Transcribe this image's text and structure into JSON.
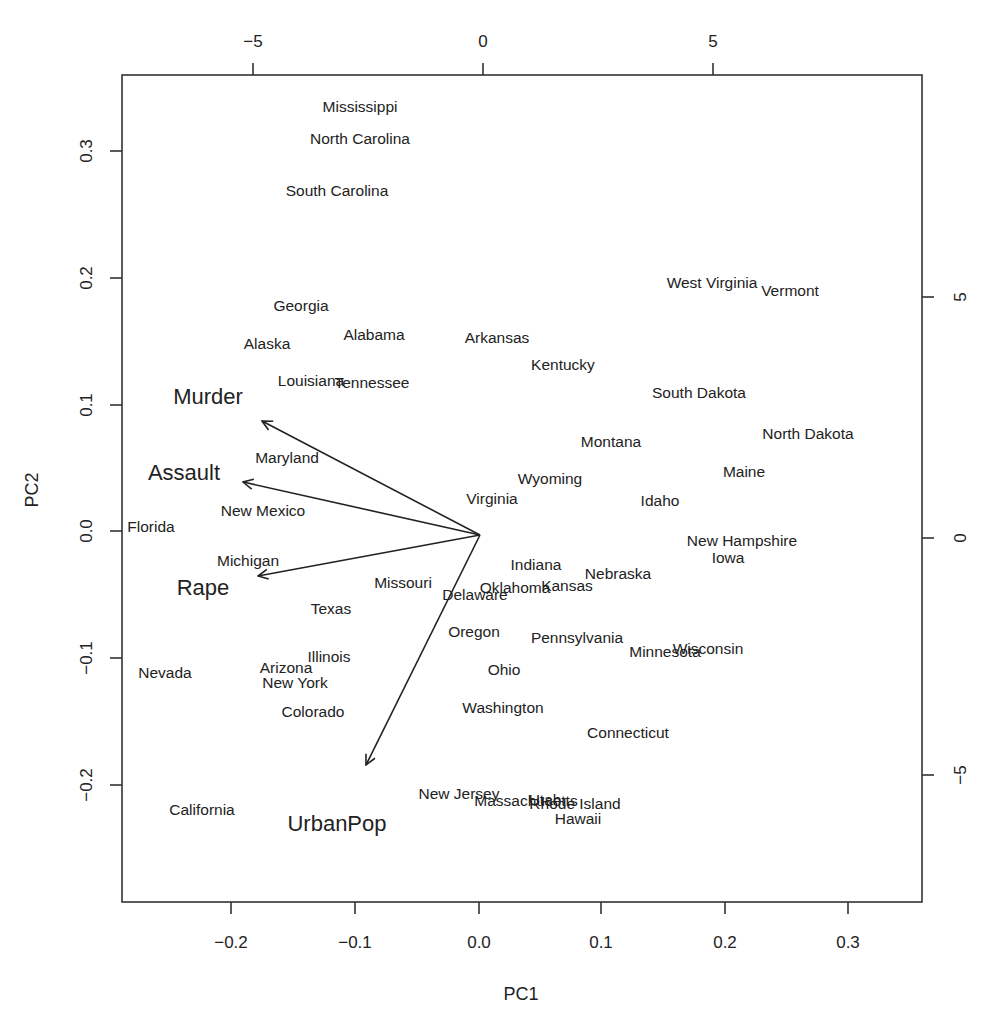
{
  "chart_data": {
    "type": "scatter",
    "subtype": "biplot",
    "title": "",
    "xlabel": "PC1",
    "ylabel": "PC2",
    "xlim": [
      -0.28,
      0.36
    ],
    "ylim": [
      -0.29,
      0.36
    ],
    "grid": false,
    "legend": "none",
    "primary_axes": {
      "bottom_ticks": [
        -0.2,
        -0.1,
        0.0,
        0.1,
        0.2,
        0.3
      ],
      "bottom_tick_labels": [
        "−0.2",
        "−0.1",
        "0.0",
        "0.1",
        "0.2",
        "0.3"
      ],
      "left_ticks": [
        -0.2,
        -0.1,
        0.0,
        0.1,
        0.2,
        0.3
      ],
      "left_tick_labels": [
        "−0.2",
        "−0.1",
        "0.0",
        "0.1",
        "0.2",
        "0.3"
      ]
    },
    "secondary_axes": {
      "top_ticks": [
        -5,
        0,
        5
      ],
      "top_tick_labels": [
        "−5",
        "0",
        "5"
      ],
      "right_ticks": [
        -5,
        0,
        5
      ],
      "right_tick_labels": [
        "−5",
        "0",
        "5"
      ]
    },
    "observations": [
      {
        "name": "Mississippi",
        "x": -0.1,
        "y": 0.33
      },
      {
        "name": "North Carolina",
        "x": -0.1,
        "y": 0.305
      },
      {
        "name": "South Carolina",
        "x": -0.12,
        "y": 0.265
      },
      {
        "name": "Georgia",
        "x": -0.15,
        "y": 0.19
      },
      {
        "name": "Alabama",
        "x": -0.11,
        "y": 0.155
      },
      {
        "name": "Alaska",
        "x": -0.175,
        "y": 0.15
      },
      {
        "name": "Arkansas",
        "x": 0.01,
        "y": 0.155
      },
      {
        "name": "Kentucky",
        "x": 0.068,
        "y": 0.13
      },
      {
        "name": "Louisiana",
        "x": -0.14,
        "y": 0.12
      },
      {
        "name": "Tennessee",
        "x": -0.11,
        "y": 0.117
      },
      {
        "name": "West Virginia",
        "x": 0.185,
        "y": 0.198
      },
      {
        "name": "Vermont",
        "x": 0.25,
        "y": 0.19
      },
      {
        "name": "South Dakota",
        "x": 0.17,
        "y": 0.108
      },
      {
        "name": "North Dakota",
        "x": 0.255,
        "y": 0.07
      },
      {
        "name": "Montana",
        "x": 0.107,
        "y": 0.072
      },
      {
        "name": "Maryland",
        "x": -0.156,
        "y": 0.06
      },
      {
        "name": "Maine",
        "x": 0.21,
        "y": 0.047
      },
      {
        "name": "Wyoming",
        "x": 0.06,
        "y": 0.044
      },
      {
        "name": "Virginia",
        "x": 0.01,
        "y": 0.03
      },
      {
        "name": "Idaho",
        "x": 0.144,
        "y": 0.027
      },
      {
        "name": "New Mexico",
        "x": -0.19,
        "y": 0.018
      },
      {
        "name": "Florida",
        "x": -0.265,
        "y": 0.004
      },
      {
        "name": "New Hampshire",
        "x": 0.215,
        "y": -0.008
      },
      {
        "name": "Iowa",
        "x": 0.2,
        "y": -0.017
      },
      {
        "name": "Michigan",
        "x": -0.2,
        "y": -0.023
      },
      {
        "name": "Indiana",
        "x": 0.045,
        "y": -0.026
      },
      {
        "name": "Nebraska",
        "x": 0.112,
        "y": -0.035
      },
      {
        "name": "Oklahoma",
        "x": 0.028,
        "y": -0.043
      },
      {
        "name": "Kansas",
        "x": 0.07,
        "y": -0.042
      },
      {
        "name": "Missouri",
        "x": -0.062,
        "y": -0.04
      },
      {
        "name": "Delaware",
        "x": -0.004,
        "y": -0.05
      },
      {
        "name": "Rape",
        "x": -0.22,
        "y": -0.045,
        "is_variable_label": true
      },
      {
        "name": "Texas",
        "x": -0.12,
        "y": -0.06
      },
      {
        "name": "Oregon",
        "x": -0.005,
        "y": -0.077
      },
      {
        "name": "Pennsylvania",
        "x": 0.08,
        "y": -0.081
      },
      {
        "name": "Minnesota",
        "x": 0.14,
        "y": -0.092
      },
      {
        "name": "Wisconsin",
        "x": 0.185,
        "y": -0.089
      },
      {
        "name": "Illinois",
        "x": -0.122,
        "y": -0.097
      },
      {
        "name": "Arizona",
        "x": -0.158,
        "y": -0.104
      },
      {
        "name": "Nevada",
        "x": -0.254,
        "y": -0.106
      },
      {
        "name": "Ohio",
        "x": 0.02,
        "y": -0.106
      },
      {
        "name": "New York",
        "x": -0.149,
        "y": -0.113
      },
      {
        "name": "Colorado",
        "x": -0.135,
        "y": -0.137
      },
      {
        "name": "Washington",
        "x": 0.02,
        "y": -0.135
      },
      {
        "name": "Connecticut",
        "x": 0.12,
        "y": -0.155
      },
      {
        "name": "New Jersey",
        "x": -0.028,
        "y": -0.205
      },
      {
        "name": "Massachusetts",
        "x": 0.04,
        "y": -0.21
      },
      {
        "name": "Utah",
        "x": 0.05,
        "y": -0.209
      },
      {
        "name": "Rhode Island",
        "x": 0.078,
        "y": -0.212
      },
      {
        "name": "Hawaii",
        "x": 0.078,
        "y": -0.225
      },
      {
        "name": "California",
        "x": -0.235,
        "y": -0.215
      }
    ],
    "variables": [
      {
        "name": "Murder",
        "x": -0.176,
        "y": 0.089
      },
      {
        "name": "Assault",
        "x": -0.191,
        "y": 0.041
      },
      {
        "name": "Rape",
        "x": -0.179,
        "y": -0.035
      },
      {
        "name": "UrbanPop",
        "x": -0.092,
        "y": -0.183
      }
    ]
  },
  "render": {
    "observation_labels": [
      {
        "text": "Mississippi",
        "px": 360,
        "py": 106
      },
      {
        "text": "North Carolina",
        "px": 360,
        "py": 138
      },
      {
        "text": "South Carolina",
        "px": 337,
        "py": 190
      },
      {
        "text": "Georgia",
        "px": 301,
        "py": 305
      },
      {
        "text": "Alabama",
        "px": 374,
        "py": 334
      },
      {
        "text": "Alaska",
        "px": 267,
        "py": 343
      },
      {
        "text": "Arkansas",
        "px": 497,
        "py": 337
      },
      {
        "text": "Kentucky",
        "px": 563,
        "py": 364
      },
      {
        "text": "Louisiana",
        "px": 311,
        "py": 380
      },
      {
        "text": "Tennessee",
        "px": 372,
        "py": 382
      },
      {
        "text": "West Virginia",
        "px": 712,
        "py": 282
      },
      {
        "text": "Vermont",
        "px": 790,
        "py": 290
      },
      {
        "text": "South Dakota",
        "px": 699,
        "py": 392
      },
      {
        "text": "North Dakota",
        "px": 808,
        "py": 433
      },
      {
        "text": "Montana",
        "px": 611,
        "py": 441
      },
      {
        "text": "Maryland",
        "px": 287,
        "py": 457
      },
      {
        "text": "Maine",
        "px": 744,
        "py": 471
      },
      {
        "text": "Wyoming",
        "px": 550,
        "py": 478
      },
      {
        "text": "Virginia",
        "px": 492,
        "py": 498
      },
      {
        "text": "Idaho",
        "px": 660,
        "py": 500
      },
      {
        "text": "New Mexico",
        "px": 263,
        "py": 510
      },
      {
        "text": "Florida",
        "px": 151,
        "py": 526
      },
      {
        "text": "New Hampshire",
        "px": 742,
        "py": 540
      },
      {
        "text": "Iowa",
        "px": 728,
        "py": 557
      },
      {
        "text": "Michigan",
        "px": 248,
        "py": 560
      },
      {
        "text": "Indiana",
        "px": 536,
        "py": 564
      },
      {
        "text": "Nebraska",
        "px": 618,
        "py": 573
      },
      {
        "text": "Oklahoma",
        "px": 515,
        "py": 587
      },
      {
        "text": "Kansas",
        "px": 567,
        "py": 585
      },
      {
        "text": "Missouri",
        "px": 403,
        "py": 582
      },
      {
        "text": "Delaware",
        "px": 475,
        "py": 594
      },
      {
        "text": "Texas",
        "px": 331,
        "py": 608
      },
      {
        "text": "Oregon",
        "px": 474,
        "py": 631
      },
      {
        "text": "Pennsylvania",
        "px": 577,
        "py": 637
      },
      {
        "text": "Minnesota",
        "px": 665,
        "py": 651
      },
      {
        "text": "Wisconsin",
        "px": 708,
        "py": 648
      },
      {
        "text": "Illinois",
        "px": 329,
        "py": 656
      },
      {
        "text": "Arizona",
        "px": 286,
        "py": 667
      },
      {
        "text": "Nevada",
        "px": 165,
        "py": 672
      },
      {
        "text": "Ohio",
        "px": 504,
        "py": 669
      },
      {
        "text": "New York",
        "px": 295,
        "py": 682
      },
      {
        "text": "Colorado",
        "px": 313,
        "py": 711
      },
      {
        "text": "Washington",
        "px": 503,
        "py": 707
      },
      {
        "text": "Connecticut",
        "px": 628,
        "py": 732
      },
      {
        "text": "New Jersey",
        "px": 459,
        "py": 793
      },
      {
        "text": "Massachusetts",
        "px": 526,
        "py": 800
      },
      {
        "text": "Utah",
        "px": 545,
        "py": 799
      },
      {
        "text": "Rhode Island",
        "px": 575,
        "py": 803
      },
      {
        "text": "Hawaii",
        "px": 578,
        "py": 818
      },
      {
        "text": "California",
        "px": 202,
        "py": 809
      }
    ],
    "variable_labels": [
      {
        "text": "Murder",
        "px": 208,
        "py": 396
      },
      {
        "text": "Assault",
        "px": 184,
        "py": 472
      },
      {
        "text": "Rape",
        "px": 203,
        "py": 587
      },
      {
        "text": "UrbanPop",
        "px": 337,
        "py": 823
      }
    ],
    "arrows": [
      {
        "name": "Murder",
        "x1": 480,
        "y1": 535,
        "x2": 262,
        "y2": 421
      },
      {
        "name": "Assault",
        "x1": 480,
        "y1": 535,
        "x2": 243,
        "y2": 482
      },
      {
        "name": "Rape",
        "x1": 480,
        "y1": 535,
        "x2": 258,
        "y2": 576
      },
      {
        "name": "UrbanPop",
        "x1": 480,
        "y1": 535,
        "x2": 366,
        "y2": 765
      }
    ],
    "box": {
      "x1": 122,
      "y1": 75,
      "x2": 922,
      "y2": 902
    },
    "bottom_ticks": [
      {
        "label": "−0.2",
        "px": 231
      },
      {
        "label": "−0.1",
        "px": 355
      },
      {
        "label": "0.0",
        "px": 479
      },
      {
        "label": "0.1",
        "px": 601
      },
      {
        "label": "0.2",
        "px": 725
      },
      {
        "label": "0.3",
        "px": 848
      }
    ],
    "left_ticks": [
      {
        "label": "0.3",
        "py": 151
      },
      {
        "label": "0.2",
        "py": 278
      },
      {
        "label": "0.1",
        "py": 405
      },
      {
        "label": "0.0",
        "py": 531
      },
      {
        "label": "−0.1",
        "py": 658
      },
      {
        "label": "−0.2",
        "py": 785
      }
    ],
    "top_ticks": [
      {
        "label": "−5",
        "px": 253
      },
      {
        "label": "0",
        "px": 483
      },
      {
        "label": "5",
        "px": 713
      }
    ],
    "right_ticks": [
      {
        "label": "5",
        "py": 297
      },
      {
        "label": "0",
        "py": 538
      },
      {
        "label": "−5",
        "py": 775
      }
    ],
    "xlabel": {
      "text": "PC1",
      "px": 521,
      "py": 1000
    },
    "ylabel": {
      "text": "PC2",
      "px": 38,
      "py": 490
    }
  }
}
